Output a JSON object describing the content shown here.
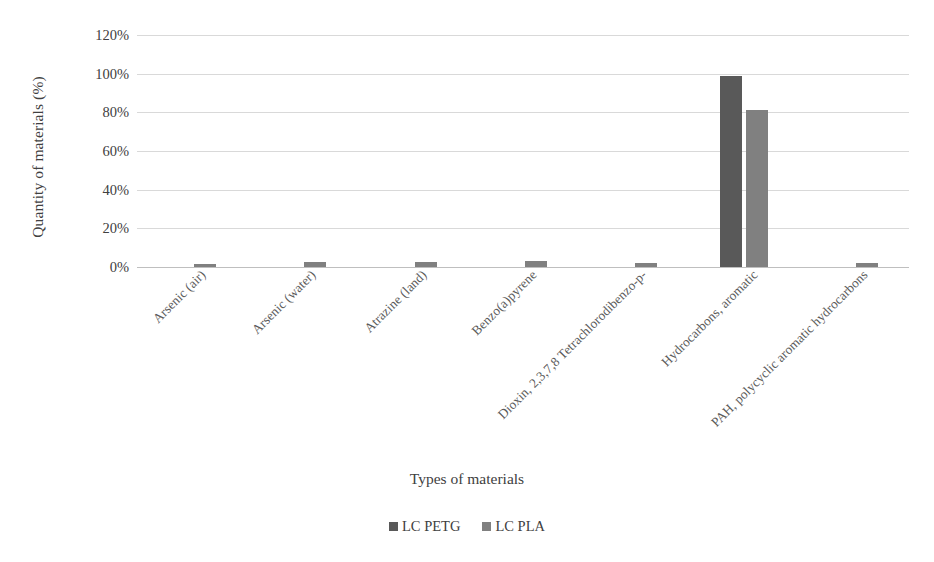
{
  "chart_data": {
    "type": "bar",
    "title": "",
    "xlabel": "Types of materials",
    "ylabel": "Quantity of materials (%)",
    "ylim": [
      0,
      120
    ],
    "ytick_labels": [
      "0%",
      "20%",
      "40%",
      "60%",
      "80%",
      "100%",
      "120%"
    ],
    "ytick_values": [
      0,
      20,
      40,
      60,
      80,
      100,
      120
    ],
    "grid": true,
    "legend_position": "bottom",
    "categories": [
      "Arsenic (air)",
      "Arsenic (water)",
      "Atrazine (land)",
      "Benzo(a)pyrene",
      "Dioxin, 2,3,7,8 Tetrachlorodibenzo-p-",
      "Hydrocarbons, aromatic",
      "PAH, polycyclic aromatic hydrocarbons"
    ],
    "series": [
      {
        "name": "LC PETG",
        "color": "#595959",
        "values": [
          0,
          0,
          0,
          0,
          0,
          99,
          0
        ]
      },
      {
        "name": "LC PLA",
        "color": "#808080",
        "values": [
          1.8,
          2.8,
          2.8,
          3.2,
          2.3,
          81,
          2.1
        ]
      }
    ]
  },
  "axes": {
    "y_title": "Quantity of materials (%)",
    "x_title": "Types of materials"
  },
  "legend": {
    "items": [
      {
        "label": "LC PETG",
        "color": "#595959"
      },
      {
        "label": "LC PLA",
        "color": "#808080"
      }
    ]
  },
  "colors": {
    "petg": "#595959",
    "pla": "#808080",
    "gridline": "#d9d9d9",
    "axis": "#bfbfbf",
    "text": "#404040"
  }
}
